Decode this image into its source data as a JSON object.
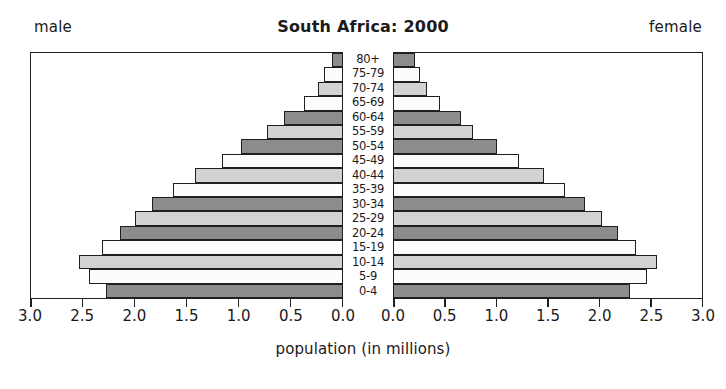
{
  "header": {
    "title": "South Africa: 2000",
    "male_label": "male",
    "female_label": "female"
  },
  "axis": {
    "caption": "population (in millions)",
    "ticks": [
      "0.0",
      "0.5",
      "1.0",
      "1.5",
      "2.0",
      "2.5",
      "3.0"
    ],
    "male_ticks": [
      "3.0",
      "2.5",
      "2.0",
      "1.5",
      "1.0",
      "0.5",
      "0.0"
    ],
    "female_ticks": [
      "0.0",
      "0.5",
      "1.0",
      "1.5",
      "2.0",
      "2.5",
      "3.0"
    ]
  },
  "colors": {
    "fill_white": "#fcfcfc",
    "fill_light": "#d2d2d2",
    "fill_dark": "#8c8c8c",
    "outline": "#1f1f1f",
    "background": "#ffffff"
  },
  "chart_data": {
    "type": "bar",
    "subtype": "population-pyramid",
    "title": "South Africa: 2000",
    "xlabel": "population (in millions)",
    "ylabel": "",
    "xlim": [
      0,
      3.0
    ],
    "xticks": [
      0.0,
      0.5,
      1.0,
      1.5,
      2.0,
      2.5,
      3.0
    ],
    "grid": false,
    "legend": "none",
    "categories": [
      "80+",
      "75-79",
      "70-74",
      "65-69",
      "60-64",
      "55-59",
      "50-54",
      "45-49",
      "40-44",
      "35-39",
      "30-34",
      "25-29",
      "20-24",
      "15-19",
      "10-14",
      "5-9",
      "0-4"
    ],
    "series": [
      {
        "name": "male",
        "side": "left",
        "values": [
          0.1,
          0.17,
          0.23,
          0.37,
          0.56,
          0.72,
          0.97,
          1.16,
          1.42,
          1.63,
          1.83,
          2.0,
          2.14,
          2.32,
          2.54,
          2.44,
          2.28
        ]
      },
      {
        "name": "female",
        "side": "right",
        "values": [
          0.2,
          0.25,
          0.32,
          0.45,
          0.65,
          0.77,
          1.0,
          1.22,
          1.46,
          1.67,
          1.86,
          2.03,
          2.18,
          2.36,
          2.56,
          2.46,
          2.3
        ]
      }
    ],
    "bar_shades": [
      "dark",
      "white",
      "light",
      "white",
      "dark",
      "light",
      "dark",
      "white",
      "light",
      "white",
      "dark",
      "light",
      "dark",
      "white",
      "light",
      "white",
      "dark"
    ]
  }
}
